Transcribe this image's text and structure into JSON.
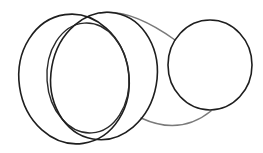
{
  "drawing": {
    "description": "Hand-drawn sketch: two overlapping large ellipses (cylinder-like), an inner ellipse, and a smaller circle on the right joined by two gray connecting curves",
    "colors": {
      "background": "#ffffff",
      "ellipse_stroke": "#1e1e1e",
      "connector_stroke": "#7a7a7a"
    },
    "shapes": [
      {
        "id": "outer-left-ellipse",
        "cx": 74,
        "cy": 79,
        "rx": 55,
        "ry": 65,
        "rotate": -8
      },
      {
        "id": "inner-ellipse",
        "cx": 88,
        "cy": 78,
        "rx": 41,
        "ry": 55,
        "rotate": -4
      },
      {
        "id": "outer-right-ellipse",
        "cx": 104,
        "cy": 76,
        "rx": 53,
        "ry": 64,
        "rotate": 10
      },
      {
        "id": "small-circle",
        "cx": 210,
        "cy": 65,
        "rx": 42,
        "ry": 45,
        "rotate": 0
      }
    ],
    "connectors": [
      {
        "id": "top-connector",
        "path": "M100,13 Q130,8 175,40"
      },
      {
        "id": "bottom-connector",
        "path": "M141,118 Q180,136 211,111"
      }
    ]
  }
}
